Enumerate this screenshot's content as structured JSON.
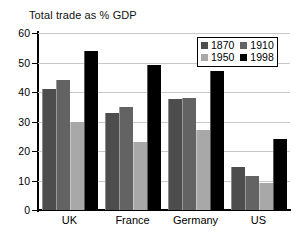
{
  "chart_data": {
    "type": "bar",
    "title": "Total trade as % GDP",
    "xlabel": "",
    "ylabel": "",
    "ylim": [
      0,
      60
    ],
    "yticks": [
      0,
      10,
      20,
      30,
      40,
      50,
      60
    ],
    "grid": true,
    "legend_position": "top-right",
    "categories": [
      "UK",
      "France",
      "Germany",
      "US"
    ],
    "series": [
      {
        "name": "1870",
        "color": "#4d4d4d",
        "values": [
          41,
          33,
          37.5,
          14.5
        ]
      },
      {
        "name": "1910",
        "color": "#636363",
        "values": [
          44,
          35,
          38,
          11.5
        ]
      },
      {
        "name": "1950",
        "color": "#a8a8a8",
        "values": [
          30,
          23,
          27,
          9
        ]
      },
      {
        "name": "1998",
        "color": "#000000",
        "values": [
          54,
          49,
          47,
          24
        ]
      }
    ]
  }
}
